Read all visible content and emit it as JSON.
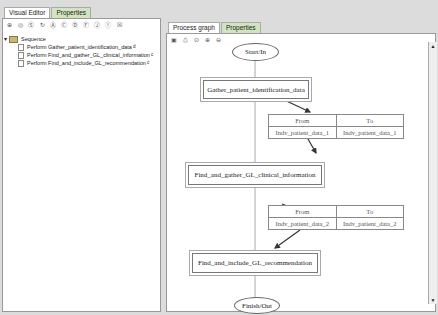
{
  "left_panel": {
    "tabs": [
      {
        "label": "Visual Editor"
      },
      {
        "label": "Properties"
      }
    ],
    "toolbar_icons": [
      "sequence-icon",
      "step-icon",
      "split-icon",
      "loop-icon",
      "action-icon",
      "choice-icon",
      "decision-icon",
      "fork-icon",
      "join-icon",
      "flow-icon",
      "delete-icon"
    ],
    "tree": {
      "root": "Sequence",
      "items": [
        {
          "label": "Perform Gather_patient_identification_data",
          "badge": "d"
        },
        {
          "label": "Perform Find_and_gather_GL_clinical_information",
          "badge": "c"
        },
        {
          "label": "Perform Find_and_include_GL_recommendation",
          "badge": "c"
        }
      ]
    }
  },
  "right_panel": {
    "tabs": [
      {
        "label": "Process graph"
      },
      {
        "label": "Properties"
      }
    ],
    "toolbar_icons": [
      "save-icon",
      "print-icon",
      "zoom-fit-icon",
      "zoom-in-icon",
      "zoom-out-icon"
    ],
    "graph": {
      "start": "Start/In",
      "finish": "Finish/Out",
      "nodes": [
        "Gather_patient_identification_data",
        "Find_and_gather_GL_clinical_information",
        "Find_and_include_GL_recommendation"
      ],
      "mappings": [
        {
          "from_header": "From",
          "to_header": "To",
          "from": "Indv_patient_data_1",
          "to": "Indv_patient_data_1"
        },
        {
          "from_header": "From",
          "to_header": "To",
          "from": "Indv_patient_data_2",
          "to": "Indv_patient_data_2"
        }
      ]
    }
  }
}
